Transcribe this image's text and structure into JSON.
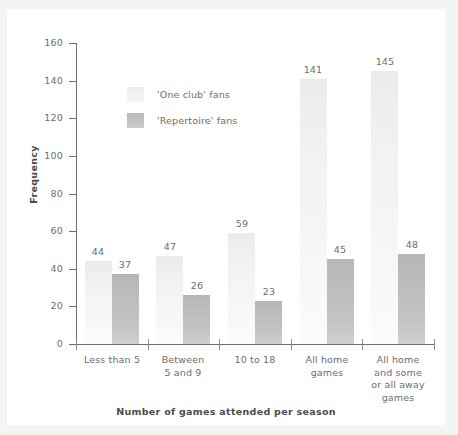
{
  "chart_data": {
    "type": "bar",
    "title": "",
    "xlabel": "Number of games attended per season",
    "ylabel": "Frequency",
    "ylim": [
      0,
      160
    ],
    "yticks": [
      0,
      20,
      40,
      60,
      80,
      100,
      120,
      140,
      160
    ],
    "grid": false,
    "legend_position": "inside-upper-left",
    "categories": [
      "Less than 5",
      "Between 5 and 9",
      "10 to 18",
      "All home games",
      "All home and some or all away games"
    ],
    "category_label_lines": [
      [
        "Less than 5"
      ],
      [
        "Between",
        "5 and 9"
      ],
      [
        "10 to 18"
      ],
      [
        "All home",
        "games"
      ],
      [
        "All home",
        "and some",
        "or all away",
        "games"
      ]
    ],
    "series": [
      {
        "name": "'One club' fans",
        "color": "#f2f2f2",
        "values": [
          44,
          47,
          59,
          141,
          145
        ]
      },
      {
        "name": "'Repertoire' fans",
        "color": "#c2c2c2",
        "values": [
          37,
          26,
          23,
          45,
          48
        ]
      }
    ]
  },
  "legend": {
    "items": [
      {
        "label": "'One club' fans",
        "swatch": "light"
      },
      {
        "label": "'Repertoire' fans",
        "swatch": "dark"
      }
    ]
  },
  "axis": {
    "y_title": "Frequency",
    "x_title": "Number of games attended per season",
    "y_tick_labels": [
      "0",
      "20",
      "40",
      "60",
      "80",
      "100",
      "120",
      "140",
      "160"
    ]
  },
  "values_flat": {
    "g1_light": "44",
    "g1_dark": "37",
    "g2_light": "47",
    "g2_dark": "26",
    "g3_light": "59",
    "g3_dark": "23",
    "g4_light": "141",
    "g4_dark": "45",
    "g5_light": "145",
    "g5_dark": "48"
  },
  "colors": {
    "background": "#ffffff",
    "axis": "#6e6e6e",
    "text": "#6d6d6d",
    "title_text": "#4b4b4b",
    "bar_light": "#f2f2f2",
    "bar_dark": "#c2c2c2",
    "page_edge": "#f4f4f5"
  }
}
